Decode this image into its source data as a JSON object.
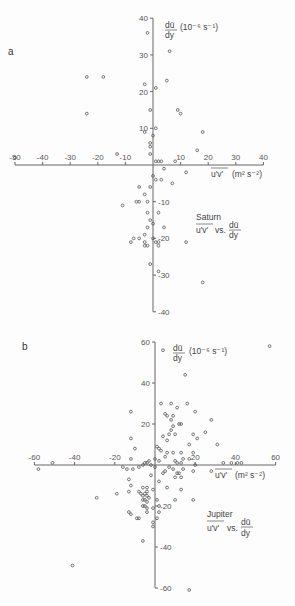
{
  "chart_data": [
    {
      "type": "scatter",
      "panel": "a",
      "title": "Saturn",
      "annotation": [
        "Saturn",
        "u'v' vs. dū/dy"
      ],
      "xlabel": "u'v' (m² s⁻²)",
      "ylabel": "dū/dy (10⁻⁶ s⁻¹)",
      "xlim": [
        -50,
        40
      ],
      "ylim": [
        -40,
        40
      ],
      "xticks": [
        -50,
        -40,
        -30,
        -20,
        -10,
        10,
        20,
        30,
        40
      ],
      "yticks": [
        40,
        30,
        20,
        10,
        -10,
        -20,
        -30,
        -40
      ],
      "grid": false,
      "points": [
        [
          -2,
          36
        ],
        [
          6,
          31
        ],
        [
          -24,
          24
        ],
        [
          -18,
          24
        ],
        [
          -3,
          22
        ],
        [
          1,
          21
        ],
        [
          5,
          23
        ],
        [
          9,
          15
        ],
        [
          10,
          14
        ],
        [
          -1,
          15
        ],
        [
          -24,
          14
        ],
        [
          1,
          10
        ],
        [
          -3,
          9
        ],
        [
          18,
          9
        ],
        [
          0,
          8
        ],
        [
          -1,
          6
        ],
        [
          -1,
          5
        ],
        [
          16,
          4
        ],
        [
          -13,
          3
        ],
        [
          -1,
          3
        ],
        [
          1,
          1
        ],
        [
          2,
          1
        ],
        [
          3,
          1
        ],
        [
          8,
          1
        ],
        [
          -50,
          2
        ],
        [
          4,
          -1
        ],
        [
          12,
          -2
        ],
        [
          0,
          -3
        ],
        [
          1,
          -4
        ],
        [
          3,
          -4
        ],
        [
          7,
          -5
        ],
        [
          -5,
          -6
        ],
        [
          -1,
          -6
        ],
        [
          -3,
          -8
        ],
        [
          -5,
          -10
        ],
        [
          -6,
          -10
        ],
        [
          -2,
          -10
        ],
        [
          -11,
          -11
        ],
        [
          -2,
          -13
        ],
        [
          2,
          -13
        ],
        [
          -1,
          -15
        ],
        [
          0,
          -16
        ],
        [
          4,
          -17
        ],
        [
          -2,
          -17
        ],
        [
          -3,
          -19
        ],
        [
          -5,
          -20
        ],
        [
          -7,
          -20
        ],
        [
          0,
          -20
        ],
        [
          1,
          -21
        ],
        [
          2,
          -21
        ],
        [
          -3,
          -21
        ],
        [
          -3,
          -22
        ],
        [
          2,
          -22
        ],
        [
          -2,
          -22
        ],
        [
          -8,
          -21
        ],
        [
          12,
          -21
        ],
        [
          -1,
          -27
        ],
        [
          2,
          -29
        ],
        [
          18,
          -32
        ]
      ]
    },
    {
      "type": "scatter",
      "panel": "b",
      "title": "Jupiter",
      "annotation": [
        "Jupiter",
        "u'v' vs. dū/dy"
      ],
      "xlabel": "u'v' (m² s⁻²)",
      "ylabel": "dū/dy (10⁻⁶ s⁻¹)",
      "xlim": [
        -60,
        60
      ],
      "ylim": [
        -60,
        60
      ],
      "xticks": [
        -60,
        -40,
        -20,
        20,
        40,
        60
      ],
      "yticks": [
        60,
        40,
        20,
        -20,
        -40,
        -60
      ],
      "grid": false,
      "points": [
        [
          4,
          56
        ],
        [
          57,
          58
        ],
        [
          15,
          44
        ],
        [
          8,
          30
        ],
        [
          16,
          30
        ],
        [
          3,
          30
        ],
        [
          11,
          28
        ],
        [
          -12,
          26
        ],
        [
          20,
          26
        ],
        [
          5,
          25
        ],
        [
          6,
          24
        ],
        [
          9,
          24
        ],
        [
          8,
          22
        ],
        [
          9,
          19
        ],
        [
          28,
          22
        ],
        [
          12,
          20
        ],
        [
          13,
          20
        ],
        [
          8,
          17
        ],
        [
          10,
          15
        ],
        [
          7,
          15
        ],
        [
          19,
          15
        ],
        [
          25,
          16
        ],
        [
          4,
          14
        ],
        [
          -12,
          13
        ],
        [
          6,
          12
        ],
        [
          21,
          13
        ],
        [
          17,
          10
        ],
        [
          31,
          10
        ],
        [
          1,
          9
        ],
        [
          2,
          8
        ],
        [
          3,
          7
        ],
        [
          -10,
          8
        ],
        [
          6,
          6
        ],
        [
          9,
          6
        ],
        [
          13,
          6
        ],
        [
          19,
          6
        ],
        [
          -12,
          3
        ],
        [
          0,
          3
        ],
        [
          5,
          4
        ],
        [
          14,
          3
        ],
        [
          17,
          3
        ],
        [
          2,
          2
        ],
        [
          10,
          2
        ],
        [
          13,
          1
        ],
        [
          -3,
          2
        ],
        [
          -4,
          1
        ],
        [
          -5,
          1
        ],
        [
          -6,
          0
        ],
        [
          -2,
          0
        ],
        [
          0,
          -1
        ],
        [
          7,
          -1
        ],
        [
          -51,
          1
        ],
        [
          -16,
          -1
        ],
        [
          -14,
          -2
        ],
        [
          -8,
          -1
        ],
        [
          11,
          1
        ],
        [
          14,
          -2
        ],
        [
          20,
          0
        ],
        [
          34,
          1
        ],
        [
          38,
          1
        ],
        [
          41,
          1
        ],
        [
          43,
          1
        ],
        [
          -58,
          -2
        ],
        [
          -11,
          -2
        ],
        [
          5,
          -3
        ],
        [
          9,
          -2
        ],
        [
          12,
          -4
        ],
        [
          11,
          -4
        ],
        [
          19,
          -3
        ],
        [
          28,
          -3
        ],
        [
          -2,
          -5
        ],
        [
          4,
          -4
        ],
        [
          10,
          -6
        ],
        [
          13,
          -6
        ],
        [
          2,
          -8
        ],
        [
          -13,
          -7
        ],
        [
          -12,
          -10
        ],
        [
          6,
          -11
        ],
        [
          13,
          -12
        ],
        [
          -4,
          -11
        ],
        [
          -6,
          -11
        ],
        [
          -1,
          -12
        ],
        [
          -4,
          -13
        ],
        [
          -8,
          -13
        ],
        [
          -13,
          -13
        ],
        [
          -19,
          -14
        ],
        [
          -29,
          -16
        ],
        [
          -7,
          -14
        ],
        [
          -5,
          -14
        ],
        [
          -4,
          -15
        ],
        [
          -6,
          -15
        ],
        [
          -3,
          -16
        ],
        [
          -5,
          -17
        ],
        [
          -4,
          -18
        ],
        [
          1,
          -17
        ],
        [
          -6,
          -17
        ],
        [
          19,
          -17
        ],
        [
          10,
          -17
        ],
        [
          -5,
          -20
        ],
        [
          -6,
          -20
        ],
        [
          -4,
          -21
        ],
        [
          2,
          -20
        ],
        [
          -1,
          -21
        ],
        [
          -4,
          -23
        ],
        [
          -13,
          -23
        ],
        [
          -12,
          -24
        ],
        [
          2,
          -23
        ],
        [
          -8,
          -26
        ],
        [
          -9,
          -26
        ],
        [
          1,
          -26
        ],
        [
          -1,
          -28
        ],
        [
          -1,
          -30
        ],
        [
          -6,
          -37
        ],
        [
          -41,
          -49
        ],
        [
          17,
          -61
        ]
      ]
    }
  ],
  "panels": {
    "a": {
      "letter": "a",
      "y_axis_title_num": "dū",
      "y_axis_title_den": "dy",
      "y_axis_units": "(10⁻⁶ s⁻¹)",
      "x_axis_title": "u'v'",
      "x_axis_units": "(m² s⁻²)",
      "name": "Saturn",
      "vs_left": "u'v'",
      "vs_mid": "vs.",
      "vs_num": "dū",
      "vs_den": "dy"
    },
    "b": {
      "letter": "b",
      "y_axis_title_num": "dū",
      "y_axis_title_den": "dy",
      "y_axis_units": "(10⁻⁶ s⁻¹)",
      "x_axis_title": "u'v'",
      "x_axis_units": "(m² s⁻²)",
      "name": "Jupiter",
      "vs_left": "u'v'",
      "vs_mid": "vs.",
      "vs_num": "dū",
      "vs_den": "dy"
    }
  },
  "colors": {
    "axis": "#666666",
    "marker": "#555555",
    "text": "#444444",
    "background": "#fdfdfd"
  }
}
